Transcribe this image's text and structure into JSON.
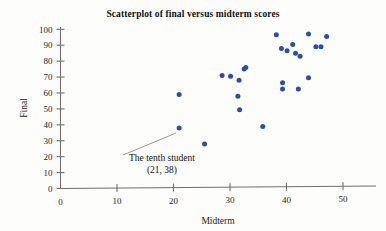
{
  "chart_data": {
    "type": "scatter",
    "title": "Scatterplot of final versus midterm scores",
    "xlabel": "Midterm",
    "ylabel": "Final",
    "xlim": [
      0,
      52
    ],
    "ylim": [
      0,
      103
    ],
    "grid": false,
    "legend": null,
    "xticks": [
      0,
      10,
      20,
      30,
      40,
      50
    ],
    "yticks": [
      0,
      10,
      20,
      30,
      40,
      50,
      60,
      70,
      80,
      90,
      100
    ],
    "xtick_labels": [
      "0",
      "10",
      "20",
      "30",
      "40",
      "50"
    ],
    "ytick_labels": [
      "0",
      "10",
      "20",
      "30",
      "40",
      "50",
      "60",
      "70",
      "80",
      "90",
      "100"
    ],
    "point_color": "#2b4fa8",
    "series": [
      {
        "name": "students",
        "points": [
          [
            21,
            59
          ],
          [
            21,
            38
          ],
          [
            25.5,
            28
          ],
          [
            28.6,
            71
          ],
          [
            30.1,
            70.5
          ],
          [
            31.6,
            68
          ],
          [
            31.4,
            58
          ],
          [
            31.7,
            49.5
          ],
          [
            32.5,
            75
          ],
          [
            32.8,
            76
          ],
          [
            35.8,
            39
          ],
          [
            38.2,
            96.5
          ],
          [
            39.1,
            88
          ],
          [
            39.3,
            66.5
          ],
          [
            39.3,
            62.5
          ],
          [
            40.1,
            86.5
          ],
          [
            41.1,
            90.5
          ],
          [
            41.6,
            85
          ],
          [
            42.1,
            62.5
          ],
          [
            42.4,
            83
          ],
          [
            43.9,
            97
          ],
          [
            43.9,
            69.5
          ],
          [
            45.2,
            89
          ],
          [
            46.1,
            89
          ],
          [
            47.1,
            95.5
          ]
        ]
      }
    ],
    "annotations": [
      {
        "line1": "The tenth student",
        "line2": "(21, 38)",
        "target_point": [
          21,
          38
        ]
      }
    ]
  }
}
